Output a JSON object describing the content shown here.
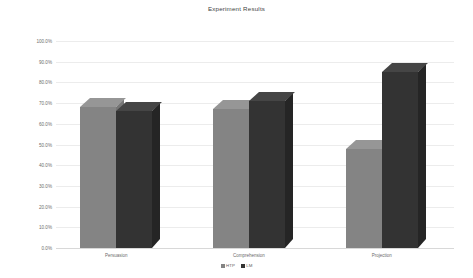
{
  "chart_data": {
    "type": "bar",
    "title": "Experiment Results",
    "xlabel": "",
    "ylabel": "",
    "categories": [
      "Persuasion",
      "Comprehension",
      "Projection"
    ],
    "series": [
      {
        "name": "HTP",
        "color": "#848484",
        "values": [
          68,
          67,
          48
        ]
      },
      {
        "name": "LM",
        "color": "#333333",
        "values": [
          66,
          71,
          85
        ]
      }
    ],
    "ylim": [
      0,
      100
    ],
    "ytick_labels": [
      "100.0%",
      "90.0%",
      "80.0%",
      "70.0%",
      "60.0%",
      "50.0%",
      "40.0%",
      "30.0%",
      "20.0%",
      "10.0%",
      "0.0%"
    ],
    "ytick_values": [
      100,
      90,
      80,
      70,
      60,
      50,
      40,
      30,
      20,
      10,
      0
    ],
    "grid": true,
    "legend_position": "bottom",
    "three_d": true,
    "background_color": "#ffffff",
    "grid_color": "#ececec",
    "text_color": "#6e6e6e"
  }
}
